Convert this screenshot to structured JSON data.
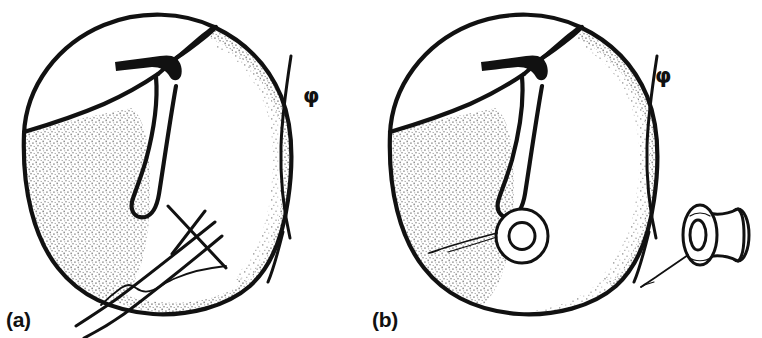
{
  "figure": {
    "kind": "medical-line-drawing",
    "background_color": "#ffffff",
    "ink_color": "#111111",
    "stipple_color": "#8c8c8c",
    "panels": [
      {
        "id": "a",
        "label": "(a)",
        "phi_symbol": "φ",
        "caption_position": "bottom-left",
        "parts": [
          {
            "name": "tympanic-membrane-outline",
            "label": ""
          },
          {
            "name": "malleus-handle",
            "label": ""
          },
          {
            "name": "lateral-process",
            "label": ""
          },
          {
            "name": "annulus-edge",
            "label": ""
          },
          {
            "name": "stippled-shading",
            "label": ""
          },
          {
            "name": "myringotomy-knife",
            "label": ""
          },
          {
            "name": "incision-line",
            "label": ""
          }
        ]
      },
      {
        "id": "b",
        "label": "(b)",
        "phi_symbol": "φ",
        "caption_position": "bottom-left",
        "parts": [
          {
            "name": "tympanic-membrane-outline",
            "label": ""
          },
          {
            "name": "malleus-handle",
            "label": ""
          },
          {
            "name": "lateral-process",
            "label": ""
          },
          {
            "name": "annulus-edge",
            "label": ""
          },
          {
            "name": "stippled-shading",
            "label": ""
          },
          {
            "name": "ventilation-tube-in-situ",
            "label": ""
          },
          {
            "name": "insertion-wire",
            "label": ""
          }
        ]
      }
    ],
    "inset": {
      "name": "grommet-tube-detail",
      "label": ""
    }
  }
}
